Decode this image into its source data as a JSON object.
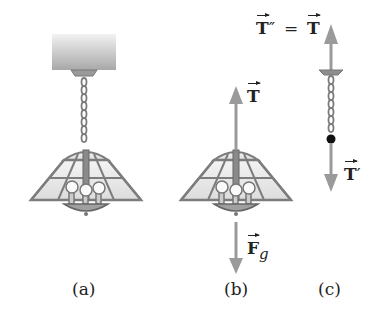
{
  "figure": {
    "panels": [
      {
        "id": "a",
        "label": "(a)",
        "description": "Lamp hanging from ceiling by chain"
      },
      {
        "id": "b",
        "label": "(b)",
        "description": "Free-body diagram of lamp"
      },
      {
        "id": "c",
        "label": "(c)",
        "description": "Free-body diagram of chain"
      }
    ],
    "vectors": {
      "b_up": {
        "symbol": "T",
        "prime": ""
      },
      "b_down": {
        "symbol": "F",
        "subscript": "g"
      },
      "c_up": {
        "lhs": "T",
        "lhs_prime": "″",
        "equals": "=",
        "rhs": "T"
      },
      "c_down": {
        "symbol": "T",
        "prime": "′"
      }
    },
    "colors": {
      "arrow": "#9a9a9a",
      "lamp_frame": "#7d7d7d",
      "glass": "#e8e8e8",
      "ceiling": "#bfbfbf",
      "dot": "#111111",
      "text": "#222222"
    }
  }
}
